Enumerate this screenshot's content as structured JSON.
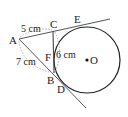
{
  "diagram": {
    "points": {
      "A": "A",
      "B": "B",
      "C": "C",
      "D": "D",
      "E": "E",
      "F": "F",
      "O": "O"
    },
    "measurements": {
      "AC": "5 cm",
      "AB": "7 cm",
      "CF": "6 cm"
    },
    "colors": {
      "line": "#333333",
      "arc_dashed": "#888888",
      "circle": "#222222"
    }
  }
}
